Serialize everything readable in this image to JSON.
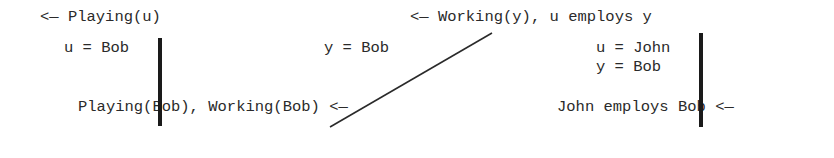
{
  "diagram": {
    "type": "resolution-derivation",
    "top": {
      "goal_left": "<— Playing(u)",
      "goal_right": "<— Working(y), u employs y"
    },
    "substitutions": {
      "left": "u = Bob",
      "middle": "y = Bob",
      "right_line1": "u = John",
      "right_line2": "y = Bob"
    },
    "bottom": {
      "facts_left": "Playing(Bob), Working(Bob) <—",
      "fact_right": "John employs Bob <—"
    },
    "edges": [
      {
        "from": "Playing(u)",
        "to": "Playing(Bob)",
        "label": "u = Bob",
        "style": "thick-vertical"
      },
      {
        "from": "Working(y)",
        "to": "Working(Bob)",
        "label": "y = Bob",
        "style": "thin-diagonal"
      },
      {
        "from": "u employs y",
        "to": "John employs Bob",
        "label": "u = John, y = Bob",
        "style": "thick-vertical"
      }
    ]
  }
}
